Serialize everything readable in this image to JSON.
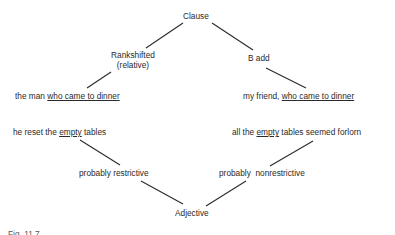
{
  "diagram": {
    "nodes": {
      "clause": "Clause",
      "rankshifted_line1": "Rankshifted",
      "rankshifted_line2": "(relative)",
      "b_add": "B add",
      "ex_left_top_plain": "the man ",
      "ex_left_top_underlined": "who came to dinner",
      "ex_right_top_plain": "my friend, ",
      "ex_right_top_underlined": "who came to dinner",
      "ex_left_bottom_pre": "he reset the ",
      "ex_left_bottom_underlined": "empty",
      "ex_left_bottom_post": " tables",
      "ex_right_bottom_pre": "all the ",
      "ex_right_bottom_underlined": "empty",
      "ex_right_bottom_post": " tables seemed forlorn",
      "probably_restrictive": "probably restrictive",
      "probably_nonrestrictive": "probably  nonrestrictive",
      "adjective": "Adjective"
    },
    "edges": [
      [
        "Clause",
        "Rankshifted (relative)"
      ],
      [
        "Clause",
        "B add"
      ],
      [
        "Rankshifted (relative)",
        "the man who came to dinner"
      ],
      [
        "B add",
        "my friend, who came to dinner"
      ],
      [
        "he reset the empty tables",
        "probably restrictive"
      ],
      [
        "all the empty tables seemed forlorn",
        "probably nonrestrictive"
      ],
      [
        "probably restrictive",
        "Adjective"
      ],
      [
        "probably nonrestrictive",
        "Adjective"
      ]
    ],
    "caption": "Fig. 11.7"
  }
}
